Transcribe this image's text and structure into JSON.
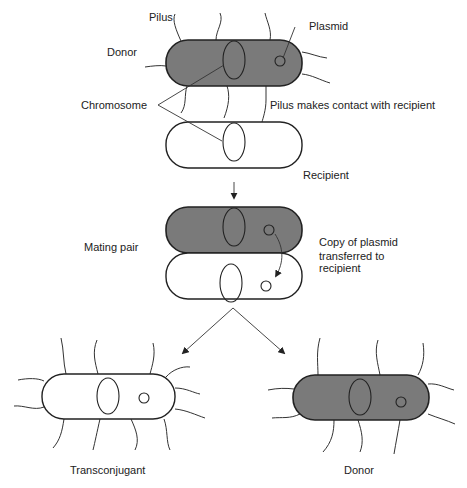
{
  "labels": {
    "pilus": "Pilus",
    "plasmid": "Plasmid",
    "donor_top": "Donor",
    "chromosome": "Chromosome",
    "pilus_contact": "Pilus makes contact with recipient",
    "recipient": "Recipient",
    "mating_pair": "Mating pair",
    "copy_line1": "Copy of plasmid",
    "copy_line2": "transferred  to",
    "copy_line3": "recipient",
    "transconjugant": "Transconjugant",
    "donor_bottom": "Donor"
  },
  "colors": {
    "donor_fill": "#7a7a7a",
    "recipient_fill": "#ffffff",
    "stroke": "#222222"
  },
  "stages": [
    {
      "name": "donor",
      "cell": "donor"
    },
    {
      "name": "recipient",
      "cell": "recipient"
    },
    {
      "name": "mating-pair",
      "cells": [
        "donor",
        "recipient"
      ]
    },
    {
      "name": "result",
      "cells": [
        "transconjugant",
        "donor"
      ]
    }
  ]
}
